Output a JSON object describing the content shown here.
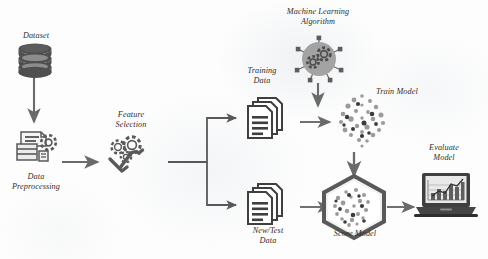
{
  "diagram": {
    "palette": {
      "dark_gray": "#4a4a4a",
      "mid_gray": "#6e6e6e",
      "light_gray": "#9a9a9a",
      "pale_gray": "#c6c6c6",
      "arrow": "#555555",
      "text": "#2e2e2e",
      "background": "#fdfdfd"
    },
    "labels": {
      "dataset": "Dataset",
      "data_preprocessing": "Data\nPreprocessing",
      "feature_selection": "Feature\nSelection",
      "training_data": "Training\nData",
      "new_test_data": "New/Test\nData",
      "ml_algorithm": "Machine Learning\nAlgorithm",
      "train_model": "Train Model",
      "score_model": "Score Model",
      "evaluate_model": "Evaluate\nModel"
    },
    "nodes": [
      {
        "id": "dataset",
        "name": "dataset-node",
        "icon": "database-cylinder-icon",
        "label": "Dataset"
      },
      {
        "id": "data-preprocessing",
        "name": "data-preprocessing-node",
        "icon": "data-preprocessing-icon",
        "label": "Data Preprocessing"
      },
      {
        "id": "feature-selection",
        "name": "feature-selection-node",
        "icon": "gears-wrench-icon",
        "label": "Feature Selection"
      },
      {
        "id": "training-data",
        "name": "training-data-node",
        "icon": "document-stack-icon",
        "label": "Training Data"
      },
      {
        "id": "new-test-data",
        "name": "new-test-data-node",
        "icon": "document-stack-icon",
        "label": "New/Test Data"
      },
      {
        "id": "ml-algorithm",
        "name": "ml-algorithm-node",
        "icon": "gears-network-circle-icon",
        "label": "Machine Learning Algorithm"
      },
      {
        "id": "train-model",
        "name": "train-model-node",
        "icon": "scatter-cluster-icon",
        "label": "Train Model"
      },
      {
        "id": "score-model",
        "name": "score-model-node",
        "icon": "hexagon-scatter-icon",
        "label": "Score Model"
      },
      {
        "id": "evaluate-model",
        "name": "evaluate-model-node",
        "icon": "laptop-chart-icon",
        "label": "Evaluate Model"
      }
    ],
    "edges": [
      {
        "from": "dataset",
        "to": "data-preprocessing",
        "direction": "down"
      },
      {
        "from": "data-preprocessing",
        "to": "feature-selection",
        "direction": "right"
      },
      {
        "from": "feature-selection",
        "to": "training-data",
        "direction": "right-branch-up"
      },
      {
        "from": "feature-selection",
        "to": "new-test-data",
        "direction": "right-branch-down"
      },
      {
        "from": "training-data",
        "to": "train-model",
        "direction": "right"
      },
      {
        "from": "ml-algorithm",
        "to": "train-model",
        "direction": "down"
      },
      {
        "from": "train-model",
        "to": "score-model",
        "direction": "down"
      },
      {
        "from": "new-test-data",
        "to": "score-model",
        "direction": "right"
      },
      {
        "from": "score-model",
        "to": "evaluate-model",
        "direction": "right"
      }
    ]
  }
}
